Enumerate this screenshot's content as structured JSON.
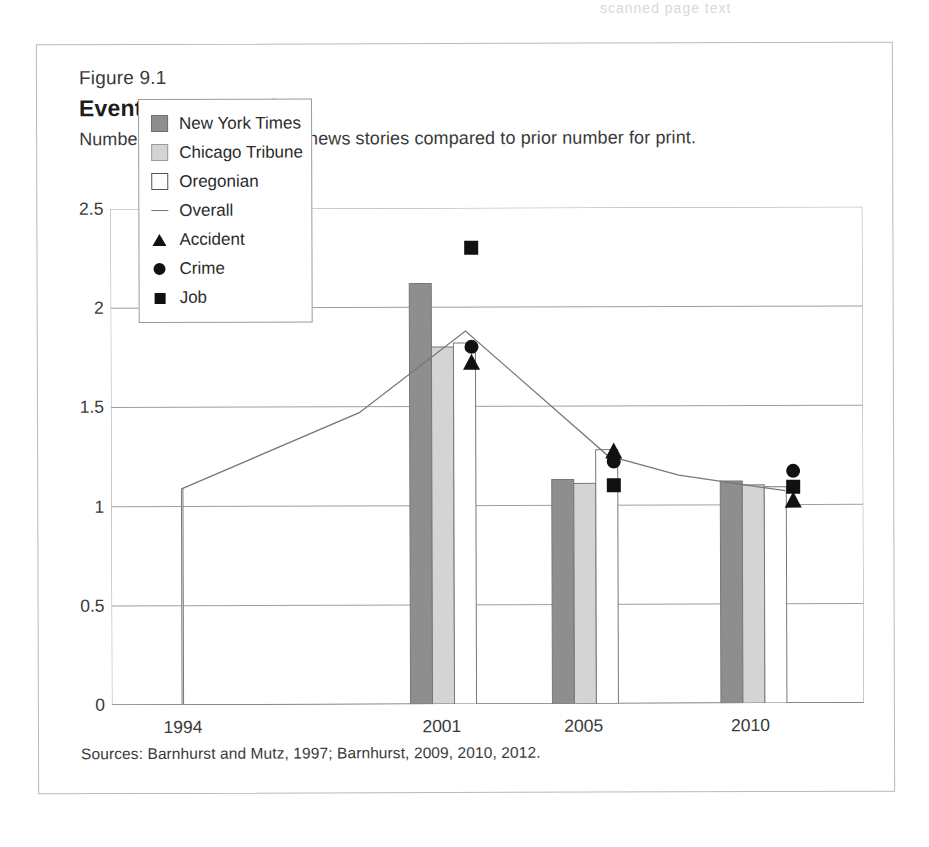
{
  "page_remnant": "scanned page text",
  "figure": {
    "number": "Figure 9.1",
    "title": "Events Spike Online",
    "subtitle": "Number of events for online news stories compared to prior number for print.",
    "source": "Sources: Barnhurst and Mutz, 1997; Barnhurst, 2009, 2010, 2012."
  },
  "legend": {
    "items": [
      {
        "label": "New York Times",
        "icon": "filled-square-dark-icon",
        "swatch": "sw-nyt",
        "color": "#8e8e8e"
      },
      {
        "label": "Chicago Tribune",
        "icon": "filled-square-light-icon",
        "swatch": "sw-chi",
        "color": "#d4d4d4"
      },
      {
        "label": "Oregonian",
        "icon": "empty-square-icon",
        "swatch": "sw-ore",
        "color": "#ffffff"
      },
      {
        "label": "Overall",
        "icon": "line-icon",
        "swatch": "sw-line",
        "color": "#777777"
      },
      {
        "label": "Accident",
        "icon": "triangle-marker-icon",
        "swatch": "sw-tri",
        "color": "#111111"
      },
      {
        "label": "Crime",
        "icon": "circle-marker-icon",
        "swatch": "sw-cir",
        "color": "#111111"
      },
      {
        "label": "Job",
        "icon": "square-marker-icon",
        "swatch": "sw-sq",
        "color": "#111111"
      }
    ]
  },
  "chart_data": {
    "type": "bar",
    "title": "Events Spike Online",
    "subtitle": "Number of events for online news stories compared to prior number for print.",
    "xlabel": "",
    "ylabel": "",
    "ylim": [
      0,
      2.5
    ],
    "yticks": [
      0,
      0.5,
      1,
      1.5,
      2,
      2.5
    ],
    "ytick_labels": [
      "0",
      "0.5",
      "1",
      "1.5",
      "2",
      "2.5"
    ],
    "yminor_step": 0.25,
    "grid": "horizontal",
    "legend_position": "inside-upper-left",
    "categories": [
      "1994",
      "2001",
      "2005",
      "2010"
    ],
    "series": [
      {
        "name": "New York Times",
        "color": "#8e8e8e",
        "values": [
          null,
          2.12,
          1.13,
          1.12
        ]
      },
      {
        "name": "Chicago Tribune",
        "color": "#d4d4d4",
        "values": [
          null,
          1.8,
          1.11,
          1.1
        ]
      },
      {
        "name": "Oregonian",
        "color": "#ffffff",
        "values": [
          1.09,
          1.82,
          1.28,
          1.09
        ]
      }
    ],
    "line_series": {
      "name": "Overall",
      "color": "#777777",
      "points": [
        {
          "x": 1994,
          "y": 1.09
        },
        {
          "x": 1999,
          "y": 1.47
        },
        {
          "x": 2002,
          "y": 1.88
        },
        {
          "x": 2006,
          "y": 1.25
        },
        {
          "x": 2008,
          "y": 1.15
        },
        {
          "x": 2011,
          "y": 1.07
        }
      ]
    },
    "markers": [
      {
        "name": "Job",
        "shape": "square",
        "x": 2002,
        "y": 2.3
      },
      {
        "name": "Crime",
        "shape": "circle",
        "x": 2002,
        "y": 1.8
      },
      {
        "name": "Accident",
        "shape": "triangle",
        "x": 2002,
        "y": 1.72
      },
      {
        "name": "Accident",
        "shape": "triangle",
        "x": 2006,
        "y": 1.27
      },
      {
        "name": "Crime",
        "shape": "circle",
        "x": 2006,
        "y": 1.22
      },
      {
        "name": "Job",
        "shape": "square",
        "x": 2006,
        "y": 1.1
      },
      {
        "name": "Crime",
        "shape": "circle",
        "x": 2011,
        "y": 1.17
      },
      {
        "name": "Job",
        "shape": "square",
        "x": 2011,
        "y": 1.09
      },
      {
        "name": "Accident",
        "shape": "triangle",
        "x": 2011,
        "y": 1.02
      }
    ]
  }
}
